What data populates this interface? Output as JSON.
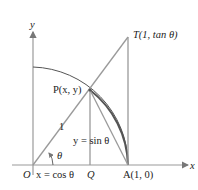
{
  "diagram": {
    "type": "unit-circle-trig",
    "labels": {
      "y_axis": "y",
      "x_axis": "x",
      "origin": "O",
      "point_T": "T(1, tan θ)",
      "point_P": "P(x, y)",
      "radius": "1",
      "sin_label": "y = sin θ",
      "angle": "θ",
      "cos_label": "x = cos θ",
      "point_Q": "Q",
      "point_A": "A(1, 0)"
    },
    "colors": {
      "line": "#9a9a9a",
      "arc": "#555555",
      "text": "#222222"
    }
  }
}
